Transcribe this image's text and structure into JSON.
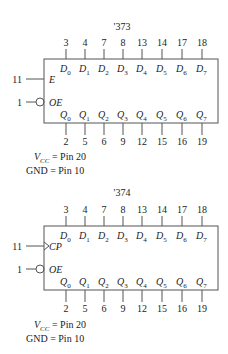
{
  "chips": [
    {
      "title": "'373",
      "data_inputs": [
        {
          "pin": "3",
          "name": "D",
          "sub": "0"
        },
        {
          "pin": "4",
          "name": "D",
          "sub": "1"
        },
        {
          "pin": "7",
          "name": "D",
          "sub": "2"
        },
        {
          "pin": "8",
          "name": "D",
          "sub": "3"
        },
        {
          "pin": "13",
          "name": "D",
          "sub": "4"
        },
        {
          "pin": "14",
          "name": "D",
          "sub": "5"
        },
        {
          "pin": "17",
          "name": "D",
          "sub": "6"
        },
        {
          "pin": "18",
          "name": "D",
          "sub": "7"
        }
      ],
      "outputs": [
        {
          "pin": "2",
          "name": "Q",
          "sub": "0"
        },
        {
          "pin": "5",
          "name": "Q",
          "sub": "1"
        },
        {
          "pin": "6",
          "name": "Q",
          "sub": "2"
        },
        {
          "pin": "9",
          "name": "Q",
          "sub": "3"
        },
        {
          "pin": "12",
          "name": "Q",
          "sub": "4"
        },
        {
          "pin": "15",
          "name": "Q",
          "sub": "5"
        },
        {
          "pin": "16",
          "name": "Q",
          "sub": "6"
        },
        {
          "pin": "19",
          "name": "Q",
          "sub": "7"
        }
      ],
      "control": [
        {
          "pin": "11",
          "name": "E",
          "type": "plain"
        },
        {
          "pin": "1",
          "name": "OE",
          "type": "inverted"
        }
      ],
      "power": {
        "vcc_label": "V",
        "vcc_sub": "CC",
        "vcc_value": " = Pin 20",
        "gnd": "GND = Pin 10"
      }
    },
    {
      "title": "'374",
      "data_inputs": [
        {
          "pin": "3",
          "name": "D",
          "sub": "0"
        },
        {
          "pin": "4",
          "name": "D",
          "sub": "1"
        },
        {
          "pin": "7",
          "name": "D",
          "sub": "2"
        },
        {
          "pin": "8",
          "name": "D",
          "sub": "3"
        },
        {
          "pin": "13",
          "name": "D",
          "sub": "4"
        },
        {
          "pin": "14",
          "name": "D",
          "sub": "5"
        },
        {
          "pin": "17",
          "name": "D",
          "sub": "6"
        },
        {
          "pin": "18",
          "name": "D",
          "sub": "7"
        }
      ],
      "outputs": [
        {
          "pin": "2",
          "name": "Q",
          "sub": "0"
        },
        {
          "pin": "5",
          "name": "Q",
          "sub": "1"
        },
        {
          "pin": "6",
          "name": "Q",
          "sub": "2"
        },
        {
          "pin": "9",
          "name": "Q",
          "sub": "3"
        },
        {
          "pin": "12",
          "name": "Q",
          "sub": "4"
        },
        {
          "pin": "15",
          "name": "Q",
          "sub": "5"
        },
        {
          "pin": "16",
          "name": "Q",
          "sub": "6"
        },
        {
          "pin": "19",
          "name": "Q",
          "sub": "7"
        }
      ],
      "control": [
        {
          "pin": "11",
          "name": "CP",
          "type": "clock"
        },
        {
          "pin": "1",
          "name": "OE",
          "type": "inverted"
        }
      ],
      "power": {
        "vcc_label": "V",
        "vcc_sub": "CC",
        "vcc_value": " = Pin 20",
        "gnd": "GND = Pin 10"
      }
    }
  ]
}
